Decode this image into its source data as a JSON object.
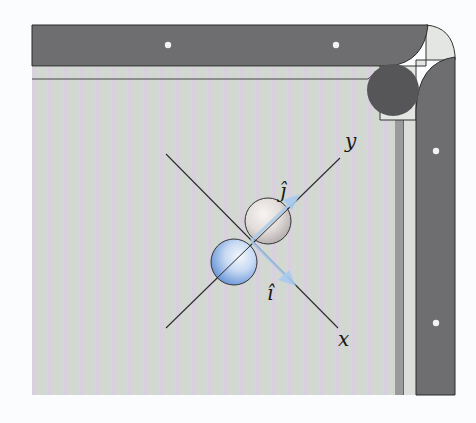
{
  "figure": {
    "colors": {
      "rail": "#6e6e70",
      "rail_edge": "#2a2a2a",
      "felt_a": "#d6d8dc",
      "felt_b": "#cfd4cc",
      "felt_c": "#d8cfdc",
      "pocket": "#555456",
      "corner_piece": "#e4e6e4",
      "diamond": "#f2f2f2",
      "ball_blue": "#8fb4e6",
      "ball_gray": "#d4cfcf",
      "unit_vector": "#a9cbee",
      "axis_line": "#2b2b2b"
    }
  },
  "labels": {
    "y_axis": "y",
    "x_axis": "x",
    "j_hat": "ĵ",
    "i_hat": "î"
  }
}
